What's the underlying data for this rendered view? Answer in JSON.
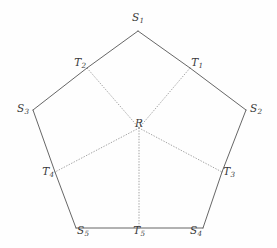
{
  "figure": {
    "type": "geometric-diagram",
    "background_color": "#fefefe",
    "solid_edge_color": "#555555",
    "dotted_edge_color": "#999999",
    "label_color": "#3a3a3a",
    "center": {
      "id": "R",
      "base": "R",
      "sub": "",
      "x": 139,
      "y": 128,
      "label_x": 139,
      "label_y": 123
    },
    "vertices": [
      {
        "id": "S1",
        "base": "S",
        "sub": "1",
        "x": 138,
        "y": 31,
        "label_x": 138,
        "label_y": 17
      },
      {
        "id": "T1",
        "base": "T",
        "sub": "1",
        "x": 190,
        "y": 68,
        "label_x": 197,
        "label_y": 62
      },
      {
        "id": "S2",
        "base": "S",
        "sub": "2",
        "x": 246,
        "y": 110,
        "label_x": 256,
        "label_y": 108
      },
      {
        "id": "T3",
        "base": "T",
        "sub": "3",
        "x": 222,
        "y": 172,
        "label_x": 229,
        "label_y": 171
      },
      {
        "id": "S4",
        "base": "S",
        "sub": "4",
        "x": 203,
        "y": 228,
        "label_x": 196,
        "label_y": 230
      },
      {
        "id": "T5",
        "base": "T",
        "sub": "5",
        "x": 139,
        "y": 228,
        "label_x": 139,
        "label_y": 230
      },
      {
        "id": "S5",
        "base": "S",
        "sub": "5",
        "x": 76,
        "y": 228,
        "label_x": 83,
        "label_y": 230
      },
      {
        "id": "T4",
        "base": "T",
        "sub": "4",
        "x": 55,
        "y": 172,
        "label_x": 48,
        "label_y": 171
      },
      {
        "id": "S3",
        "base": "S",
        "sub": "3",
        "x": 33,
        "y": 110,
        "label_x": 23,
        "label_y": 108
      },
      {
        "id": "T2",
        "base": "T",
        "sub": "2",
        "x": 87,
        "y": 68,
        "label_x": 80,
        "label_y": 62
      }
    ],
    "solid_edges": [
      {
        "from": "T2",
        "to": "S1"
      },
      {
        "from": "S1",
        "to": "T1"
      },
      {
        "from": "T1",
        "to": "S2"
      },
      {
        "from": "S2",
        "to": "T3"
      },
      {
        "from": "T3",
        "to": "S4"
      },
      {
        "from": "S4",
        "to": "T5"
      },
      {
        "from": "T5",
        "to": "S5"
      },
      {
        "from": "S5",
        "to": "T4"
      },
      {
        "from": "T4",
        "to": "S3"
      },
      {
        "from": "S3",
        "to": "T2"
      }
    ],
    "dotted_edges": [
      {
        "from": "R",
        "to": "T1"
      },
      {
        "from": "R",
        "to": "T2"
      },
      {
        "from": "R",
        "to": "T3"
      },
      {
        "from": "R",
        "to": "T4"
      },
      {
        "from": "R",
        "to": "T5"
      }
    ]
  }
}
